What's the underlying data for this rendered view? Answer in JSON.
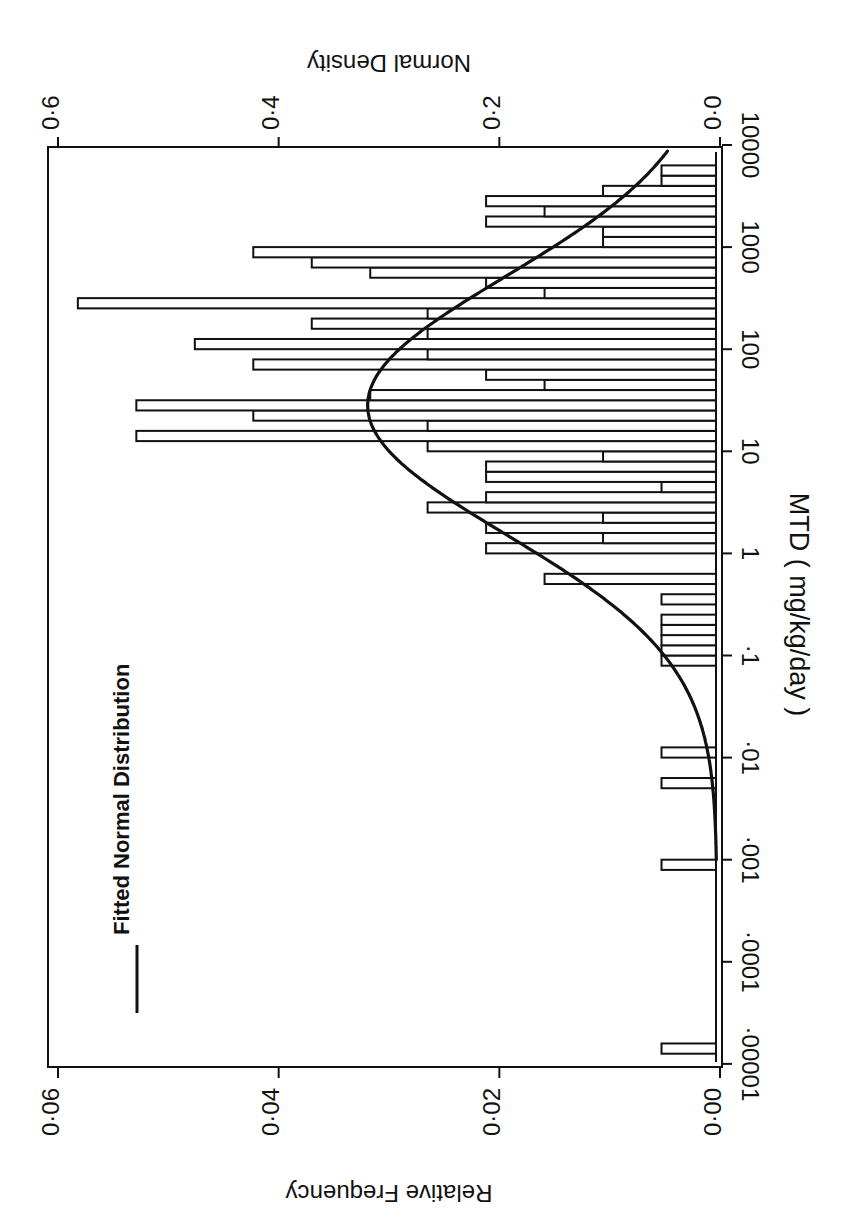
{
  "chart_data": {
    "type": "bar",
    "orientation": "rotated-90-clockwise",
    "title": "",
    "xlabel": "MTD  ( mg/kg/day )",
    "ylabel": "Relative  Frequency",
    "ylabel_right": "Normal  Density",
    "x_scale": "log10",
    "xlim_log10": [
      -5,
      4
    ],
    "x_ticks": [
      {
        "log": -5,
        "label": "·00001"
      },
      {
        "log": -4,
        "label": "·0001"
      },
      {
        "log": -3,
        "label": "·001"
      },
      {
        "log": -2,
        "label": "·01"
      },
      {
        "log": -1,
        "label": "·1"
      },
      {
        "log": 0,
        "label": "1"
      },
      {
        "log": 1,
        "label": "10"
      },
      {
        "log": 2,
        "label": "100"
      },
      {
        "log": 3,
        "label": "1000"
      },
      {
        "log": 4,
        "label": "10000"
      }
    ],
    "ylim": [
      0,
      0.06
    ],
    "y_ticks": [
      {
        "value": 0.0,
        "label": "0·00"
      },
      {
        "value": 0.02,
        "label": "0·02"
      },
      {
        "value": 0.04,
        "label": "0·04"
      },
      {
        "value": 0.06,
        "label": "0·06"
      }
    ],
    "ylim_right": [
      0,
      0.6
    ],
    "y_ticks_right": [
      {
        "value": 0.0,
        "label": "0·0"
      },
      {
        "value": 0.2,
        "label": "0·2"
      },
      {
        "value": 0.4,
        "label": "0·4"
      },
      {
        "value": 0.6,
        "label": "0·6"
      }
    ],
    "bin_width_log10": 0.1,
    "bins": [
      {
        "log_lo": -4.9,
        "freq": 0.0053
      },
      {
        "log_lo": -3.1,
        "freq": 0.0053
      },
      {
        "log_lo": -2.3,
        "freq": 0.0053
      },
      {
        "log_lo": -2.0,
        "freq": 0.0053
      },
      {
        "log_lo": -1.1,
        "freq": 0.0053
      },
      {
        "log_lo": -1.0,
        "freq": 0.0053
      },
      {
        "log_lo": -0.9,
        "freq": 0.0053
      },
      {
        "log_lo": -0.8,
        "freq": 0.0053
      },
      {
        "log_lo": -0.7,
        "freq": 0.0053
      },
      {
        "log_lo": -0.5,
        "freq": 0.0053
      },
      {
        "log_lo": -0.3,
        "freq": 0.0159
      },
      {
        "log_lo": 0.0,
        "freq": 0.0212
      },
      {
        "log_lo": 0.1,
        "freq": 0.0106
      },
      {
        "log_lo": 0.2,
        "freq": 0.0212
      },
      {
        "log_lo": 0.3,
        "freq": 0.0106
      },
      {
        "log_lo": 0.4,
        "freq": 0.0265
      },
      {
        "log_lo": 0.5,
        "freq": 0.0212
      },
      {
        "log_lo": 0.6,
        "freq": 0.0053
      },
      {
        "log_lo": 0.7,
        "freq": 0.0212
      },
      {
        "log_lo": 0.8,
        "freq": 0.0212
      },
      {
        "log_lo": 0.9,
        "freq": 0.0106
      },
      {
        "log_lo": 1.0,
        "freq": 0.0265
      },
      {
        "log_lo": 1.1,
        "freq": 0.0529
      },
      {
        "log_lo": 1.2,
        "freq": 0.0265
      },
      {
        "log_lo": 1.3,
        "freq": 0.0423
      },
      {
        "log_lo": 1.4,
        "freq": 0.0529
      },
      {
        "log_lo": 1.5,
        "freq": 0.0317
      },
      {
        "log_lo": 1.6,
        "freq": 0.0159
      },
      {
        "log_lo": 1.7,
        "freq": 0.0212
      },
      {
        "log_lo": 1.8,
        "freq": 0.0423
      },
      {
        "log_lo": 1.9,
        "freq": 0.0265
      },
      {
        "log_lo": 2.0,
        "freq": 0.0476
      },
      {
        "log_lo": 2.1,
        "freq": 0.0265
      },
      {
        "log_lo": 2.2,
        "freq": 0.037
      },
      {
        "log_lo": 2.3,
        "freq": 0.0265
      },
      {
        "log_lo": 2.4,
        "freq": 0.0582
      },
      {
        "log_lo": 2.5,
        "freq": 0.0159
      },
      {
        "log_lo": 2.6,
        "freq": 0.0212
      },
      {
        "log_lo": 2.7,
        "freq": 0.0317
      },
      {
        "log_lo": 2.8,
        "freq": 0.037
      },
      {
        "log_lo": 2.9,
        "freq": 0.0423
      },
      {
        "log_lo": 3.0,
        "freq": 0.0106
      },
      {
        "log_lo": 3.1,
        "freq": 0.0106
      },
      {
        "log_lo": 3.2,
        "freq": 0.0212
      },
      {
        "log_lo": 3.3,
        "freq": 0.0159
      },
      {
        "log_lo": 3.4,
        "freq": 0.0212
      },
      {
        "log_lo": 3.5,
        "freq": 0.0106
      },
      {
        "log_lo": 3.6,
        "freq": 0.0053
      },
      {
        "log_lo": 3.7,
        "freq": 0.0053
      }
    ],
    "fitted_curve": {
      "name": "Fitted  Normal  Distribution",
      "distribution": "normal",
      "mean_log10": 1.45,
      "sd_log10": 1.26,
      "log_range": [
        -3.0,
        3.95
      ],
      "axis": "right"
    },
    "legend": {
      "position": "top-left",
      "entries": [
        "Fitted  Normal  Distribution"
      ]
    },
    "grid": false
  }
}
